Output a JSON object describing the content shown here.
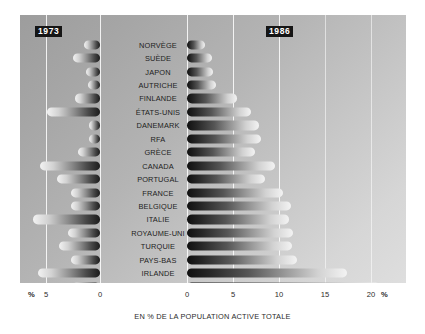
{
  "chart_data": {
    "type": "bar",
    "title": "",
    "subtitle": "",
    "xlabel": "EN % DE LA POPULATION ACTIVE TOTALE",
    "ylabel": "",
    "orientation": "horizontal",
    "layout": "bidirectional-pyramid",
    "grid": true,
    "legend_position": "inline-badges",
    "categories": [
      "NORVÈGE",
      "SUÈDE",
      "JAPON",
      "AUTRICHE",
      "FINLANDE",
      "ÉTATS-UNIS",
      "DANEMARK",
      "RFA",
      "GRÈCE",
      "CANADA",
      "PORTUGAL",
      "FRANCE",
      "BELGIQUE",
      "ITALIE",
      "ROYAUME-UNI",
      "TURQUIE",
      "PAYS-BAS",
      "IRLANDE",
      "ESPAGNE"
    ],
    "series": [
      {
        "name": "1973",
        "side": "left",
        "axis_direction": "reversed",
        "axis_ticks": [
          5,
          0
        ],
        "axis_range": [
          5,
          0
        ],
        "unit": "%",
        "values": [
          1.5,
          2.5,
          1.3,
          1.1,
          2.3,
          4.9,
          1.0,
          1.0,
          2.0,
          5.6,
          4.0,
          2.7,
          2.7,
          6.2,
          3.0,
          3.8,
          2.7,
          5.7,
          2.6
        ]
      },
      {
        "name": "1986",
        "side": "right",
        "axis_direction": "normal",
        "axis_ticks": [
          0,
          5,
          10,
          15,
          20
        ],
        "axis_range": [
          0,
          21
        ],
        "unit": "%",
        "values": [
          2.0,
          2.7,
          2.8,
          3.1,
          5.4,
          7.0,
          7.8,
          8.0,
          7.4,
          9.6,
          8.5,
          10.4,
          11.3,
          11.1,
          11.5,
          11.4,
          12.0,
          17.4,
          21.0
        ]
      }
    ]
  },
  "badges": {
    "left_year": "1973",
    "right_year": "1986"
  },
  "axis": {
    "left_pct_symbol": "%",
    "left_ticks": [
      "5",
      "0"
    ],
    "right_ticks": [
      "0",
      "5",
      "10",
      "15",
      "20"
    ],
    "right_pct_symbol": "%"
  },
  "caption": "EN % DE LA POPULATION ACTIVE TOTALE",
  "colors": {
    "panel_light": "#dedede",
    "panel_dark": "#9d9d9d",
    "bar_dark": "#101010",
    "bar_light": "#f3f3f3",
    "gridline": "#ffffff",
    "badge_background": "#151515",
    "badge_text": "#ffffff",
    "text": "#1d1d1d"
  }
}
